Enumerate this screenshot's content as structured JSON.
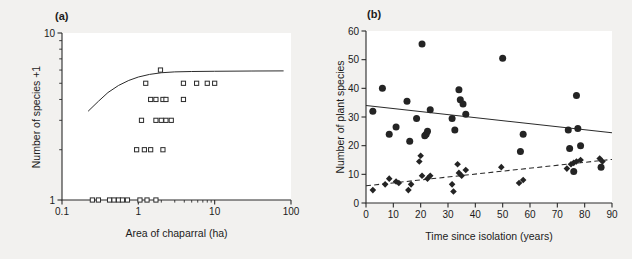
{
  "figure": {
    "background_color": "#f2f1ef",
    "ink_color": "#2b2b2b",
    "plot_background": "#ffffff"
  },
  "panels": [
    {
      "key": "a",
      "label": "(a)",
      "xlabel": "Area of chaparral (ha)",
      "ylabel": "Number of species +1"
    },
    {
      "key": "b",
      "label": "(b)",
      "xlabel": "Time since isolation (years)",
      "ylabel": "Number of plant species"
    }
  ],
  "chart_data": [
    {
      "type": "scatter",
      "panel": "a",
      "title": "(a)",
      "xlabel": "Area of chaparral (ha)",
      "ylabel": "Number of species +1",
      "xscale": "log",
      "yscale": "log",
      "xlim": [
        0.1,
        100
      ],
      "ylim": [
        1,
        10
      ],
      "xticks": [
        0.1,
        1,
        10,
        100
      ],
      "xtick_labels": [
        "0.1",
        "1",
        "10",
        "100"
      ],
      "yticks": [
        1,
        10
      ],
      "ytick_labels": [
        "1",
        "10"
      ],
      "grid": false,
      "legend": "none",
      "marker": "open-square",
      "series": [
        {
          "name": "chaparral fragments",
          "marker": "open-square",
          "points": [
            [
              0.25,
              1.0
            ],
            [
              0.3,
              1.0
            ],
            [
              0.42,
              1.0
            ],
            [
              0.48,
              1.0
            ],
            [
              0.55,
              1.0
            ],
            [
              0.62,
              1.0
            ],
            [
              0.72,
              1.0
            ],
            [
              1.05,
              1.0
            ],
            [
              1.3,
              1.0
            ],
            [
              1.7,
              1.0
            ],
            [
              0.95,
              2.0
            ],
            [
              1.2,
              2.0
            ],
            [
              1.45,
              2.0
            ],
            [
              2.1,
              2.0
            ],
            [
              1.1,
              3.0
            ],
            [
              1.7,
              3.0
            ],
            [
              2.0,
              3.0
            ],
            [
              2.3,
              3.0
            ],
            [
              2.7,
              3.0
            ],
            [
              1.45,
              4.0
            ],
            [
              1.7,
              4.0
            ],
            [
              2.1,
              4.0
            ],
            [
              2.3,
              4.0
            ],
            [
              3.9,
              4.0
            ],
            [
              1.25,
              5.0
            ],
            [
              3.9,
              5.0
            ],
            [
              5.8,
              5.0
            ],
            [
              8.0,
              5.0
            ],
            [
              10.0,
              5.0
            ],
            [
              1.95,
              6.0
            ]
          ]
        }
      ],
      "fitted_curve": {
        "style": "solid",
        "description": "saturating species-area curve rising from ~3.4 at 0.22 ha to asymptote ~5.9 near 80 ha",
        "points": [
          [
            0.22,
            3.4
          ],
          [
            0.3,
            3.9
          ],
          [
            0.4,
            4.4
          ],
          [
            0.55,
            4.85
          ],
          [
            0.75,
            5.2
          ],
          [
            1.0,
            5.45
          ],
          [
            1.4,
            5.65
          ],
          [
            2.0,
            5.78
          ],
          [
            3.0,
            5.85
          ],
          [
            5.0,
            5.88
          ],
          [
            10.0,
            5.9
          ],
          [
            30.0,
            5.92
          ],
          [
            80.0,
            5.93
          ]
        ]
      }
    },
    {
      "type": "scatter",
      "panel": "b",
      "title": "(b)",
      "xlabel": "Time since isolation (years)",
      "ylabel": "Number of plant species",
      "xscale": "linear",
      "yscale": "linear",
      "xlim": [
        0,
        90
      ],
      "ylim": [
        0,
        60
      ],
      "xticks": [
        0,
        10,
        20,
        30,
        40,
        50,
        60,
        70,
        80,
        90
      ],
      "xtick_labels": [
        "0",
        "10",
        "20",
        "30",
        "40",
        "50",
        "60",
        "70",
        "80",
        "90"
      ],
      "yticks": [
        0,
        10,
        20,
        30,
        40,
        50,
        60
      ],
      "ytick_labels": [
        "0",
        "10",
        "20",
        "30",
        "40",
        "50",
        "60"
      ],
      "grid": false,
      "legend": "none",
      "series": [
        {
          "name": "native species",
          "marker": "filled-circle",
          "trendline": "solid",
          "points": [
            [
              2.5,
              32.0
            ],
            [
              6.0,
              40.0
            ],
            [
              8.5,
              24.0
            ],
            [
              11.0,
              26.5
            ],
            [
              15.0,
              35.5
            ],
            [
              16.0,
              21.5
            ],
            [
              18.5,
              29.5
            ],
            [
              20.5,
              55.5
            ],
            [
              21.5,
              23.5
            ],
            [
              22.0,
              24.0
            ],
            [
              22.5,
              25.0
            ],
            [
              23.5,
              32.5
            ],
            [
              31.5,
              29.5
            ],
            [
              32.5,
              25.5
            ],
            [
              34.0,
              39.5
            ],
            [
              34.5,
              36.0
            ],
            [
              35.5,
              34.5
            ],
            [
              36.5,
              31.0
            ],
            [
              50.0,
              50.5
            ],
            [
              56.5,
              18.0
            ],
            [
              57.5,
              24.0
            ],
            [
              74.0,
              25.5
            ],
            [
              74.5,
              19.0
            ],
            [
              77.0,
              37.5
            ],
            [
              77.5,
              26.0
            ],
            [
              78.5,
              20.0
            ],
            [
              76.0,
              11.0
            ],
            [
              86.0,
              12.5
            ]
          ]
        },
        {
          "name": "exotic species",
          "marker": "filled-diamond",
          "trendline": "dashed",
          "points": [
            [
              2.5,
              4.5
            ],
            [
              7.0,
              6.5
            ],
            [
              8.5,
              8.5
            ],
            [
              11.0,
              7.5
            ],
            [
              12.0,
              7.0
            ],
            [
              15.5,
              4.5
            ],
            [
              16.5,
              6.5
            ],
            [
              19.5,
              14.5
            ],
            [
              20.0,
              16.5
            ],
            [
              20.5,
              9.5
            ],
            [
              22.5,
              8.5
            ],
            [
              23.5,
              9.5
            ],
            [
              31.5,
              6.5
            ],
            [
              32.0,
              4.0
            ],
            [
              33.5,
              13.5
            ],
            [
              34.0,
              10.5
            ],
            [
              35.0,
              9.5
            ],
            [
              36.5,
              11.5
            ],
            [
              49.5,
              12.5
            ],
            [
              56.0,
              7.0
            ],
            [
              57.5,
              8.0
            ],
            [
              73.5,
              12.0
            ],
            [
              75.0,
              13.5
            ],
            [
              76.0,
              14.0
            ],
            [
              77.0,
              14.5
            ],
            [
              78.5,
              15.0
            ],
            [
              85.5,
              15.5
            ],
            [
              86.5,
              14.5
            ]
          ]
        }
      ],
      "trendlines": [
        {
          "name": "native species trend",
          "style": "solid",
          "x_start": 0,
          "y_start": 34.0,
          "x_end": 90,
          "y_end": 24.5
        },
        {
          "name": "exotic species trend",
          "style": "dashed",
          "x_start": 0,
          "y_start": 6.0,
          "x_end": 90,
          "y_end": 15.2
        }
      ]
    }
  ]
}
